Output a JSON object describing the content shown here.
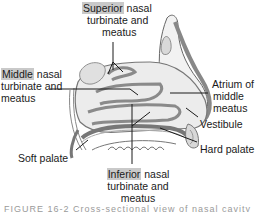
{
  "figure": {
    "labels": {
      "superior": {
        "highlight": "Superior",
        "rest_line1": " nasal",
        "line2": "turbinate and",
        "line3": "meatus"
      },
      "middle": {
        "highlight": "Middle",
        "rest_line1": " nasal",
        "line2": "turbinate and",
        "line3": "meatus"
      },
      "atrium": {
        "line1": "Atrium of",
        "line2": "middle",
        "line3": "meatus"
      },
      "vestibule": "Vestibule",
      "hard_palate": "Hard palate",
      "soft_palate": "Soft palate",
      "inferior": {
        "highlight": "Inferior",
        "rest_line1": " nasal",
        "line2": "turbinate and",
        "line3": "meatus"
      }
    },
    "caption": "FIGURE 16-2  Cross-sectional view of nasal cavity",
    "colors": {
      "highlight": "#c9c9c9",
      "tissue_fill": "#e6e6e6",
      "tissue_dark": "#8a8a8a",
      "line": "#1a1a1a"
    }
  }
}
